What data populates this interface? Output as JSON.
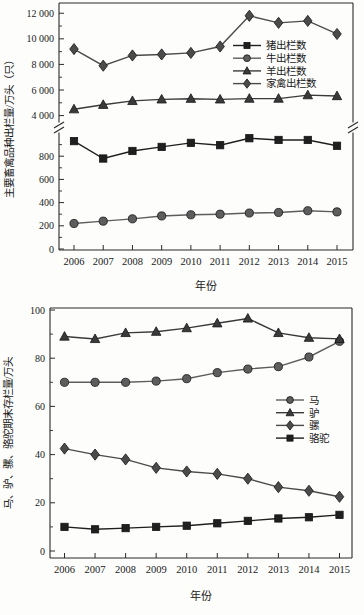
{
  "colors": {
    "axis": "#2a2a2a",
    "text": "#1a1a1a",
    "background": "#fdfdfc"
  },
  "chart_data": [
    {
      "type": "line",
      "title": "",
      "xlabel": "年份",
      "ylabel": "主要畜禽品种出栏量/万头（只）",
      "categories": [
        "2006",
        "2007",
        "2008",
        "2009",
        "2010",
        "2011",
        "2012",
        "2013",
        "2014",
        "2015"
      ],
      "axis_break": true,
      "grid": false,
      "legend_position": "upper-right-inside",
      "panels": [
        {
          "name": "upper",
          "ylim": [
            3500,
            12800
          ],
          "ticks": [
            4000,
            6000,
            8000,
            10000,
            12000
          ],
          "tick_labels": [
            "4 000",
            "6 000",
            "8 000",
            "10 000",
            "12 000"
          ]
        },
        {
          "name": "lower",
          "ylim": [
            0,
            1000
          ],
          "ticks": [
            0,
            200,
            400,
            600,
            800
          ],
          "tick_labels": [
            "0",
            "200",
            "400",
            "600",
            "800"
          ]
        }
      ],
      "series": [
        {
          "id": "pig",
          "name": "猪出栏数",
          "marker": "square",
          "panel": "lower",
          "color": "#1f1f1f",
          "values": [
            930,
            780,
            845,
            880,
            915,
            895,
            955,
            940,
            940,
            890
          ]
        },
        {
          "id": "cattle",
          "name": "牛出栏数",
          "marker": "circle",
          "panel": "lower",
          "color": "#5d5d5d",
          "values": [
            220,
            240,
            260,
            285,
            295,
            300,
            310,
            315,
            330,
            320
          ]
        },
        {
          "id": "sheep",
          "name": "羊出栏数",
          "marker": "triangle",
          "panel": "upper",
          "color": "#3a3a3a",
          "values": [
            4500,
            4850,
            5150,
            5270,
            5320,
            5270,
            5330,
            5330,
            5600,
            5530
          ]
        },
        {
          "id": "poultry",
          "name": "家禽出栏数",
          "marker": "diamond",
          "panel": "upper",
          "color": "#4b4b4b",
          "values": [
            9200,
            7900,
            8700,
            8780,
            8900,
            9400,
            11800,
            11250,
            11400,
            10380
          ]
        }
      ]
    },
    {
      "type": "line",
      "title": "",
      "xlabel": "年份",
      "ylabel": "马、驴、骡、骆驼期末存栏量/万头",
      "categories": [
        "2006",
        "2007",
        "2008",
        "2009",
        "2010",
        "2011",
        "2012",
        "2013",
        "2014",
        "2015"
      ],
      "axis_break": false,
      "grid": false,
      "legend_position": "right-middle-inside",
      "panels": [
        {
          "name": "main",
          "ylim": [
            0,
            100
          ],
          "ticks": [
            0,
            20,
            40,
            60,
            80,
            100
          ],
          "tick_labels": [
            "0",
            "20",
            "40",
            "60",
            "80",
            "100"
          ]
        }
      ],
      "series": [
        {
          "id": "horse",
          "name": "马",
          "marker": "circle",
          "panel": "main",
          "color": "#5d5d5d",
          "values": [
            70,
            70,
            70,
            70.5,
            71.5,
            74,
            75.5,
            76.5,
            80.5,
            87
          ]
        },
        {
          "id": "donkey",
          "name": "驴",
          "marker": "triangle",
          "panel": "main",
          "color": "#3a3a3a",
          "values": [
            89,
            88,
            90.5,
            91,
            92.5,
            94.5,
            96.5,
            90.5,
            88.5,
            88
          ]
        },
        {
          "id": "mule",
          "name": "骡",
          "marker": "diamond",
          "panel": "main",
          "color": "#4b4b4b",
          "values": [
            42.5,
            40,
            38,
            34.5,
            33,
            32,
            30,
            26.5,
            25,
            22.5
          ]
        },
        {
          "id": "camel",
          "name": "骆驼",
          "marker": "square",
          "panel": "main",
          "color": "#1f1f1f",
          "values": [
            10,
            9,
            9.5,
            10,
            10.5,
            11.5,
            12.5,
            13.5,
            14,
            15
          ]
        }
      ]
    }
  ]
}
